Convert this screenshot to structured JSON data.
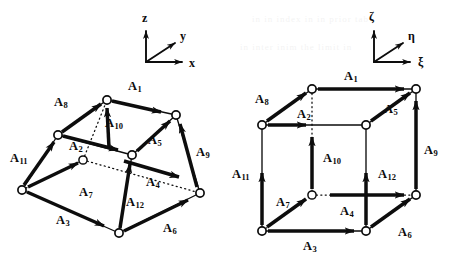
{
  "figure": {
    "ink_color": "#0d0d0d",
    "background_color": "#ffffff"
  },
  "left_panel": {
    "name": "distorted-hexahedron",
    "axis_triad": {
      "name": "xyz-triad",
      "origin": [
        146,
        62
      ],
      "axes": [
        {
          "label": "x",
          "dir": "right",
          "tip": [
            186,
            62
          ],
          "label_pos": [
            189,
            57
          ]
        },
        {
          "label": "y",
          "dir": "up-right",
          "tip": [
            178,
            40
          ],
          "label_pos": [
            180,
            30
          ]
        },
        {
          "label": "z",
          "dir": "up",
          "tip": [
            146,
            26
          ],
          "label_pos": [
            142,
            12
          ]
        }
      ]
    },
    "nodes": [
      {
        "id": "n1",
        "x": 22,
        "y": 190,
        "hidden": false
      },
      {
        "id": "n2",
        "x": 119,
        "y": 233,
        "hidden": false
      },
      {
        "id": "n3",
        "x": 200,
        "y": 193,
        "hidden": false
      },
      {
        "id": "n4",
        "x": 83,
        "y": 160,
        "hidden": true
      },
      {
        "id": "n5",
        "x": 58,
        "y": 135,
        "hidden": false
      },
      {
        "id": "n6",
        "x": 107,
        "y": 100,
        "hidden": false
      },
      {
        "id": "n7",
        "x": 176,
        "y": 115,
        "hidden": false
      },
      {
        "id": "n8",
        "x": 132,
        "y": 155,
        "hidden": false
      }
    ],
    "edge_labels": [
      {
        "label": "A",
        "sub": "1",
        "x": 128,
        "y": 80
      },
      {
        "label": "A",
        "sub": "2",
        "x": 69,
        "y": 140
      },
      {
        "label": "A",
        "sub": "3",
        "x": 56,
        "y": 214
      },
      {
        "label": "A",
        "sub": "4",
        "x": 146,
        "y": 176
      },
      {
        "label": "A",
        "sub": "5",
        "x": 148,
        "y": 134
      },
      {
        "label": "A",
        "sub": "6",
        "x": 163,
        "y": 222
      },
      {
        "label": "A",
        "sub": "7",
        "x": 79,
        "y": 186
      },
      {
        "label": "A",
        "sub": "8",
        "x": 54,
        "y": 96
      },
      {
        "label": "A",
        "sub": "9",
        "x": 196,
        "y": 146
      },
      {
        "label": "A",
        "sub": "10",
        "x": 105,
        "y": 117
      },
      {
        "label": "A",
        "sub": "11",
        "x": 10,
        "y": 152
      },
      {
        "label": "A",
        "sub": "12",
        "x": 126,
        "y": 196
      }
    ]
  },
  "right_panel": {
    "name": "reference-cube",
    "axis_triad": {
      "name": "xi-eta-zeta-triad",
      "origin": [
        374,
        62
      ],
      "axes": [
        {
          "label": "ξ",
          "dir": "right",
          "tip": [
            414,
            62
          ],
          "label_pos": [
            418,
            56
          ]
        },
        {
          "label": "η",
          "dir": "up-right",
          "tip": [
            406,
            40
          ],
          "label_pos": [
            408,
            30
          ]
        },
        {
          "label": "ζ",
          "dir": "up",
          "tip": [
            374,
            26
          ],
          "label_pos": [
            369,
            11
          ]
        }
      ]
    },
    "nodes": [
      {
        "id": "m1",
        "x": 262,
        "y": 125,
        "hidden": false
      },
      {
        "id": "m2",
        "x": 366,
        "y": 125,
        "hidden": false
      },
      {
        "id": "m3",
        "x": 366,
        "y": 231,
        "hidden": false
      },
      {
        "id": "m4",
        "x": 262,
        "y": 231,
        "hidden": false
      },
      {
        "id": "m5",
        "x": 312,
        "y": 89,
        "hidden": false
      },
      {
        "id": "m6",
        "x": 416,
        "y": 89,
        "hidden": false
      },
      {
        "id": "m7",
        "x": 416,
        "y": 195,
        "hidden": false
      },
      {
        "id": "m8",
        "x": 312,
        "y": 195,
        "hidden": true
      }
    ],
    "edge_labels": [
      {
        "label": "A",
        "sub": "1",
        "x": 344,
        "y": 70
      },
      {
        "label": "A",
        "sub": "2",
        "x": 297,
        "y": 108
      },
      {
        "label": "A",
        "sub": "3",
        "x": 303,
        "y": 240
      },
      {
        "label": "A",
        "sub": "4",
        "x": 340,
        "y": 205
      },
      {
        "label": "A",
        "sub": "5",
        "x": 384,
        "y": 103
      },
      {
        "label": "A",
        "sub": "6",
        "x": 398,
        "y": 226
      },
      {
        "label": "A",
        "sub": "7",
        "x": 276,
        "y": 196
      },
      {
        "label": "A",
        "sub": "8",
        "x": 255,
        "y": 93
      },
      {
        "label": "A",
        "sub": "9",
        "x": 424,
        "y": 144
      },
      {
        "label": "A",
        "sub": "10",
        "x": 323,
        "y": 152
      },
      {
        "label": "A",
        "sub": "11",
        "x": 232,
        "y": 168
      },
      {
        "label": "A",
        "sub": "12",
        "x": 378,
        "y": 168
      }
    ]
  },
  "artifacts": {
    "note": "faint bleed-through text from reverse page",
    "lines": [
      {
        "text": "in in index in in prior tab",
        "x": 252,
        "y": 14
      },
      {
        "text": "in inter inim the limit in",
        "x": 240,
        "y": 42
      }
    ]
  }
}
